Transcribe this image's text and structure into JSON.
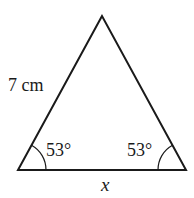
{
  "diagram": {
    "type": "isosceles-triangle",
    "side_label": "7 cm",
    "base_label": "x",
    "left_angle_label": "53°",
    "right_angle_label": "53°",
    "stroke_color": "#1a1a1a",
    "background": "#ffffff"
  }
}
